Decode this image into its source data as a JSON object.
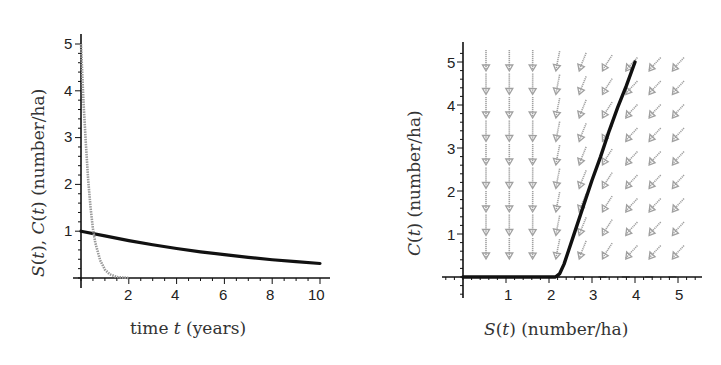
{
  "chart_data": [
    {
      "type": "line",
      "title": "",
      "xlabel": "time t (years)",
      "ylabel": "S(t), C(t) (number/ha)",
      "xlim": [
        0,
        10.4
      ],
      "ylim": [
        0,
        5.2
      ],
      "x_ticks": [
        2,
        4,
        6,
        8,
        10
      ],
      "y_ticks": [
        1,
        2,
        3,
        4,
        5
      ],
      "grid": false,
      "legend": null,
      "series": [
        {
          "name": "S(t)",
          "color": "#111111",
          "style": "thick solid",
          "x": [
            0,
            1,
            2,
            3,
            4,
            5,
            6,
            7,
            8,
            9,
            10
          ],
          "values": [
            1.0,
            0.9,
            0.8,
            0.71,
            0.63,
            0.56,
            0.5,
            0.44,
            0.39,
            0.35,
            0.31
          ]
        },
        {
          "name": "C(t)",
          "color": "#9a9a9a",
          "style": "gray dotted",
          "x": [
            0,
            0.1,
            0.2,
            0.3,
            0.4,
            0.5,
            0.6,
            0.8,
            1.0,
            1.2,
            1.5,
            2.0
          ],
          "values": [
            5.0,
            3.8,
            2.9,
            2.1,
            1.5,
            1.05,
            0.75,
            0.38,
            0.18,
            0.08,
            0.02,
            0.0
          ]
        }
      ]
    },
    {
      "type": "line",
      "title": "",
      "xlabel": "S(t) (number/ha)",
      "ylabel": "C(t) (number/ha)",
      "xlim": [
        -0.1,
        5.5
      ],
      "ylim": [
        -0.4,
        5.3
      ],
      "x_ticks": [
        1,
        2,
        3,
        4,
        5
      ],
      "y_ticks": [
        1,
        2,
        3,
        4,
        5
      ],
      "grid": false,
      "legend": null,
      "annotations": [
        "direction field arrows (gray) on a 9x9 grid pointing down / down-left"
      ],
      "series": [
        {
          "name": "trajectory (S,C)",
          "color": "#111111",
          "style": "thick solid",
          "x": [
            4.0,
            3.8,
            3.6,
            3.4,
            3.2,
            3.0,
            2.8,
            2.6,
            2.45,
            2.35,
            2.25,
            2.15,
            1.5,
            1.0,
            0.5,
            0.0
          ],
          "values": [
            5.0,
            4.45,
            3.95,
            3.4,
            2.8,
            2.25,
            1.65,
            1.05,
            0.6,
            0.3,
            0.08,
            0.0,
            0.0,
            0.0,
            0.0,
            0.0
          ]
        }
      ]
    }
  ],
  "left": {
    "y_tick_labels": [
      "1",
      "2",
      "3",
      "4",
      "5"
    ],
    "x_tick_labels": [
      "2",
      "4",
      "6",
      "8",
      "10"
    ],
    "xlabel_parts": {
      "pre": "time ",
      "var": "t",
      "post": " (years)"
    },
    "ylabel_parts": {
      "s": "S",
      "t1": "(",
      "tv1": "t",
      "t2": "), ",
      "c": "C",
      "t3": "(",
      "tv2": "t",
      "t4": ") (number/ha)"
    }
  },
  "right": {
    "y_tick_labels": [
      "1",
      "2",
      "3",
      "4",
      "5"
    ],
    "x_tick_labels": [
      "1",
      "2",
      "3",
      "4",
      "5"
    ],
    "xlabel_parts": {
      "s": "S",
      "p1": "(",
      "tv": "t",
      "p2": ") (number/ha)"
    },
    "ylabel_parts": {
      "c": "C",
      "p1": "(",
      "tv": "t",
      "p2": ") (number/ha)"
    }
  },
  "colors": {
    "curve": "#111111",
    "field": "#a0a0a0",
    "axis": "#111111"
  }
}
